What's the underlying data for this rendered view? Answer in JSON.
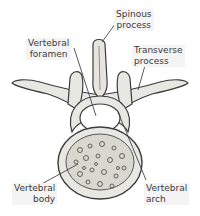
{
  "diagram": {
    "labels": {
      "spinous_process": "Spinous\nprocess",
      "vertebral_foramen": "Vertebral\nforamen",
      "transverse_process": "Transverse\nprocess",
      "vertebral_body": "Vertebral\nbody",
      "vertebral_arch": "Vertebral\narch"
    },
    "colors": {
      "bone": "#e8e8e2",
      "outline": "#3c3c3c",
      "label_bg": "#f4f4f4",
      "text": "#3a3a3a"
    }
  }
}
